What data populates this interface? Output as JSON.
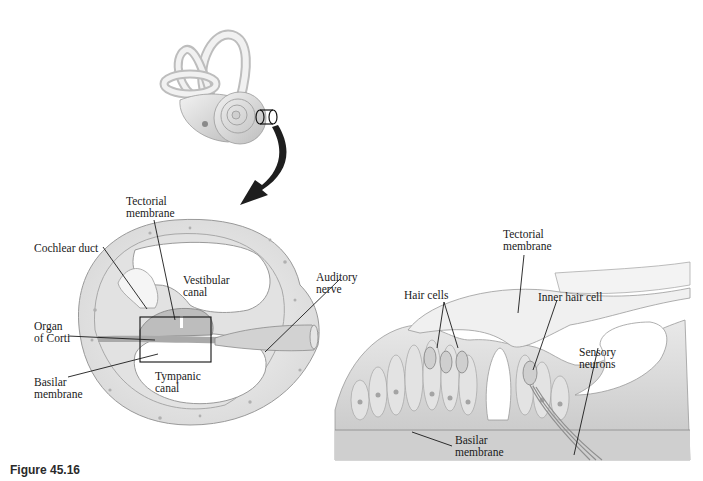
{
  "figure": {
    "caption": "Figure 45.16",
    "panels": [
      {
        "id": "inner-ear",
        "description": "Inner ear overview with cochlea; band marks cross-section location, arrow points down to section"
      },
      {
        "id": "cochlea-cross-section",
        "labels": {
          "tectorial_membrane": "Tectorial\nmembrane",
          "cochlear_duct": "Cochlear duct",
          "vestibular_canal": "Vestibular\ncanal",
          "auditory_nerve": "Auditory\nnerve",
          "organ_of_corti": "Organ\nof Corti",
          "basilar_membrane": "Basilar\nmembrane",
          "tympanic_canal": "Tympanic\ncanal"
        }
      },
      {
        "id": "organ-of-corti-detail",
        "labels": {
          "tectorial_membrane": "Tectorial\nmembrane",
          "hair_cells": "Hair cells",
          "inner_hair_cell": "Inner hair cell",
          "sensory_neurons": "Sensory\nneurons",
          "basilar_membrane": "Basilar\nmembrane"
        }
      }
    ],
    "colors": {
      "tissue_light": "#efefef",
      "tissue_mid": "#d9d9d9",
      "tissue_dark": "#b5b5b5",
      "outline": "#8a8a8a",
      "leader": "#1a1a1a",
      "arrow": "#1e1e1e"
    }
  }
}
